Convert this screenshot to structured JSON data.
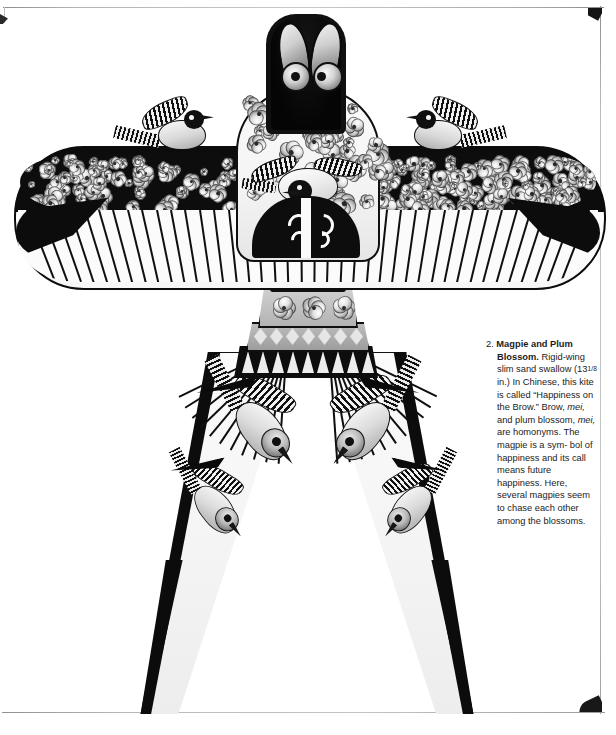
{
  "page": {
    "background_color": "#ffffff",
    "frame_color": "#9a9a9a",
    "text_color": "#1c1c1c"
  },
  "figure": {
    "name": "magpie-and-plum-blossom-kite",
    "parts": [
      "head-panel",
      "center-body-shield",
      "wing-bar",
      "drum-neck",
      "tail-legs"
    ]
  },
  "caption": {
    "number": "2.",
    "title": "Magpie and Plum Blossom.",
    "line_1": "Rigid-wing",
    "line_2": "slim sand swallow",
    "line_3_pre": "(13",
    "line_3_frac": "1/8",
    "line_3_post": "in.) In Chinese,",
    "line_4": "this kite is called",
    "line_5": "“Happiness on the",
    "line_6_pre": "Brow.” Brow,",
    "line_6_ital": "mei,",
    "line_7": "and plum blossom,",
    "line_8_ital": "mei,",
    "line_8_post": "are homonyms.",
    "line_9": "The magpie is a sym-",
    "line_10": "bol of happiness and",
    "line_11": "its call means future",
    "line_12": "happiness. Here,",
    "line_13": "several magpies seem",
    "line_14": "to chase each other",
    "line_15": "among the blossoms.",
    "full_text": "2. Magpie and Plum Blossom. Rigid-wing slim sand swallow (13 1/8 in.) In Chinese, this kite is called “Happiness on the Brow.” Brow, mei, and plum blossom, mei, are homonyms. The magpie is a symbol of happiness and its call means future happiness. Here, several magpies seem to chase each other among the blossoms."
  }
}
